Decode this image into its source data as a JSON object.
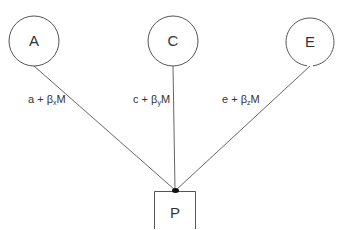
{
  "diagram": {
    "nodes": [
      {
        "id": "A",
        "label": "A",
        "shape": "circle"
      },
      {
        "id": "C",
        "label": "C",
        "shape": "circle"
      },
      {
        "id": "E",
        "label": "E",
        "shape": "circle"
      },
      {
        "id": "P",
        "label": "P",
        "shape": "box"
      }
    ],
    "edges": [
      {
        "from": "A",
        "to": "P",
        "label_prefix": "a + β",
        "label_sub": "x",
        "label_suffix": "M"
      },
      {
        "from": "C",
        "to": "P",
        "label_prefix": "c + β",
        "label_sub": "y",
        "label_suffix": "M"
      },
      {
        "from": "E",
        "to": "P",
        "label_prefix": "e + β",
        "label_sub": "z",
        "label_suffix": "M"
      }
    ],
    "colors": {
      "stroke": "#555555",
      "text": "#333333",
      "junction": "#111111",
      "background": "#ffffff"
    }
  }
}
